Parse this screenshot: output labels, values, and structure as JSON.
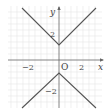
{
  "diagram": {
    "type": "function-graph",
    "axes": {
      "x_label": "x",
      "y_label": "y",
      "origin_label": "O",
      "x_ticks": [
        {
          "value": -2,
          "label": "−2"
        },
        {
          "value": 2,
          "label": "2"
        }
      ],
      "y_ticks": [
        {
          "value": 2,
          "label": "2"
        },
        {
          "value": -2,
          "label": "−2"
        }
      ]
    },
    "curves": [
      {
        "name": "upper-v",
        "equation": "y = |x| + 1",
        "vertex": [
          0,
          1
        ]
      },
      {
        "name": "lower-v",
        "equation": "y = -|x| - 1",
        "vertex": [
          0,
          -1
        ]
      }
    ],
    "colors": {
      "curve": "#555555",
      "axis": "#666666",
      "grid": "#e4e4e4"
    }
  }
}
